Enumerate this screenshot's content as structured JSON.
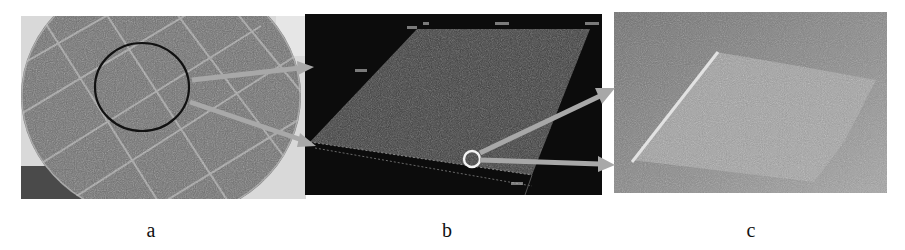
{
  "figure": {
    "panels": [
      {
        "id": "a",
        "label": "a",
        "description": "Photograph of a circular sample surface with a grid of light crack lines; black circle marks the region of interest",
        "background_color": "#7a7a7a",
        "marker": {
          "shape": "circle",
          "color": "#111111"
        }
      },
      {
        "id": "b",
        "label": "b",
        "description": "3D surface scan of the marked region on a black background, shown as a tilted grey plane; white circle marks a detail region",
        "background_color": "#0c0c0c",
        "marker": {
          "shape": "circle",
          "color": "#ffffff"
        },
        "axis_labels_visible": true
      },
      {
        "id": "c",
        "label": "c",
        "description": "Magnified 3D view of the detail region showing a rough textured surface layer",
        "background_color": "#8d8d8d"
      }
    ],
    "arrows": {
      "color": "#a8a8a8",
      "a_to_b": 2,
      "b_to_c": 2
    }
  }
}
